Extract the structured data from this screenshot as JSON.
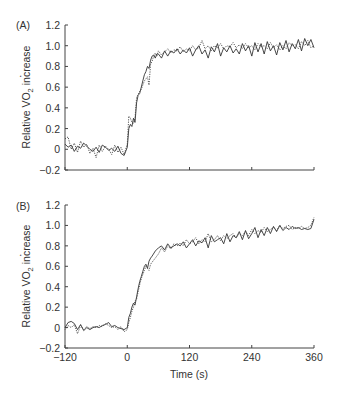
{
  "chart_data": [
    {
      "type": "line",
      "panel_label": "(A)",
      "title": "",
      "xlabel": "",
      "ylabel": "Relative V̇O2 increase",
      "xlim": [
        -120,
        360
      ],
      "ylim": [
        -0.2,
        1.2
      ],
      "x_ticks": [
        -120,
        0,
        120,
        240,
        360
      ],
      "x_tick_labels_shown": false,
      "y_ticks": [
        -0.2,
        0,
        0.2,
        0.4,
        0.6,
        0.8,
        1.0,
        1.2
      ],
      "y_tick_labels": [
        "−0.2",
        "0",
        "0.2",
        "0.4",
        "0.6",
        "0.8",
        "1.0",
        "1.2"
      ],
      "grid": false,
      "legend": null,
      "series": [
        {
          "name": "solid",
          "style": "solid",
          "x": [
            -120,
            -114,
            -108,
            -102,
            -96,
            -90,
            -84,
            -78,
            -72,
            -66,
            -60,
            -54,
            -48,
            -42,
            -36,
            -30,
            -24,
            -18,
            -12,
            -6,
            0,
            3,
            6,
            9,
            12,
            15,
            18,
            21,
            24,
            27,
            30,
            33,
            36,
            39,
            42,
            45,
            48,
            51,
            54,
            57,
            60,
            66,
            72,
            78,
            84,
            90,
            96,
            102,
            108,
            114,
            120,
            126,
            132,
            138,
            144,
            150,
            156,
            162,
            168,
            174,
            180,
            186,
            192,
            198,
            204,
            210,
            216,
            222,
            228,
            234,
            240,
            246,
            252,
            258,
            264,
            270,
            276,
            282,
            288,
            294,
            300,
            306,
            312,
            318,
            324,
            330,
            336,
            342,
            348,
            354,
            360
          ],
          "y": [
            0.05,
            0.02,
            0.04,
            -0.02,
            0.03,
            0.01,
            0.06,
            0.03,
            0.0,
            -0.02,
            0.02,
            -0.03,
            0.04,
            0.02,
            -0.01,
            0.01,
            -0.02,
            0.03,
            -0.04,
            -0.06,
            0.02,
            0.2,
            0.24,
            0.22,
            0.3,
            0.26,
            0.45,
            0.52,
            0.54,
            0.6,
            0.66,
            0.72,
            0.75,
            0.8,
            0.78,
            0.86,
            0.9,
            0.91,
            0.88,
            0.92,
            0.92,
            0.88,
            0.95,
            0.9,
            0.95,
            0.93,
            0.97,
            0.92,
            0.96,
            0.93,
            0.98,
            0.9,
            0.96,
            1.0,
            0.92,
            0.96,
            0.88,
            0.99,
            0.94,
            1.02,
            0.9,
            0.98,
            0.94,
            1.0,
            0.93,
            0.97,
            0.92,
            1.02,
            0.95,
            1.0,
            0.9,
            1.03,
            0.94,
            1.02,
            0.92,
            1.04,
            0.95,
            1.0,
            0.91,
            1.03,
            0.96,
            1.05,
            0.94,
            1.02,
            0.97,
            1.06,
            0.95,
            1.07,
            1.0,
            1.06,
            0.98
          ]
        },
        {
          "name": "dotted",
          "style": "dotted",
          "x": [
            -120,
            -114,
            -108,
            -102,
            -96,
            -90,
            -84,
            -78,
            -72,
            -66,
            -60,
            -54,
            -48,
            -42,
            -36,
            -30,
            -24,
            -18,
            -12,
            -6,
            0,
            3,
            6,
            9,
            12,
            15,
            18,
            21,
            24,
            27,
            30,
            33,
            36,
            39,
            42,
            45,
            48,
            51,
            54,
            57,
            60,
            66,
            72,
            78,
            84,
            90,
            96,
            102,
            108,
            114,
            120,
            126,
            132,
            138,
            144,
            150,
            156,
            162,
            168,
            174,
            180,
            186,
            192,
            198,
            204,
            210,
            216,
            222,
            228,
            234,
            240,
            246,
            252,
            258,
            264,
            270,
            276,
            282,
            288,
            294,
            300,
            306,
            312,
            318,
            324,
            330,
            336,
            342,
            348,
            354,
            360
          ],
          "y": [
            0.1,
            0.12,
            0.0,
            0.06,
            -0.03,
            0.08,
            0.02,
            0.05,
            -0.04,
            0.01,
            -0.08,
            0.04,
            -0.02,
            0.03,
            0.0,
            -0.05,
            0.04,
            -0.03,
            0.02,
            -0.05,
            0.05,
            0.32,
            0.3,
            0.26,
            0.25,
            0.3,
            0.5,
            0.53,
            0.56,
            0.58,
            0.62,
            0.66,
            0.68,
            0.7,
            0.62,
            0.82,
            0.85,
            0.9,
            0.93,
            0.9,
            0.95,
            0.91,
            0.94,
            0.97,
            0.93,
            0.96,
            0.95,
            0.99,
            0.94,
            0.97,
            0.95,
            1.0,
            0.96,
            0.98,
            1.05,
            0.97,
            1.0,
            0.95,
            1.0,
            0.98,
            1.02,
            0.97,
            1.0,
            0.99,
            1.03,
            0.98,
            1.01,
            0.97,
            1.02,
            0.98,
            1.0,
            0.96,
            1.02,
            0.99,
            1.0,
            0.97,
            1.03,
            0.98,
            1.01,
            0.96,
            1.0,
            0.97,
            1.03,
            1.0,
            1.01,
            0.97,
            1.04,
            1.0,
            1.05,
            0.98,
            1.0
          ]
        }
      ]
    },
    {
      "type": "line",
      "panel_label": "(B)",
      "title": "",
      "xlabel": "Time (s)",
      "ylabel": "Relative V̇O2 increase",
      "xlim": [
        -120,
        360
      ],
      "ylim": [
        -0.2,
        1.2
      ],
      "x_ticks": [
        -120,
        0,
        120,
        240,
        360
      ],
      "x_tick_labels": [
        "−120",
        "0",
        "120",
        "240",
        "360"
      ],
      "y_ticks": [
        -0.2,
        0,
        0.2,
        0.4,
        0.6,
        0.8,
        1.0,
        1.2
      ],
      "y_tick_labels": [
        "−0.2",
        "0",
        "0.2",
        "0.4",
        "0.6",
        "0.8",
        "1.0",
        "1.2"
      ],
      "grid": false,
      "legend": null,
      "series": [
        {
          "name": "solid",
          "style": "solid",
          "x": [
            -120,
            -114,
            -108,
            -102,
            -96,
            -90,
            -84,
            -78,
            -72,
            -66,
            -60,
            -54,
            -48,
            -42,
            -36,
            -30,
            -24,
            -18,
            -12,
            -6,
            0,
            3,
            6,
            9,
            12,
            15,
            18,
            21,
            24,
            27,
            30,
            33,
            36,
            39,
            42,
            45,
            48,
            54,
            60,
            66,
            72,
            78,
            84,
            90,
            96,
            102,
            108,
            114,
            120,
            126,
            132,
            138,
            144,
            150,
            156,
            162,
            168,
            174,
            180,
            186,
            192,
            198,
            204,
            210,
            216,
            222,
            228,
            234,
            240,
            246,
            252,
            258,
            264,
            270,
            276,
            282,
            288,
            294,
            300,
            306,
            312,
            318,
            324,
            330,
            336,
            342,
            348,
            354,
            360
          ],
          "y": [
            0.0,
            0.05,
            0.06,
            0.04,
            -0.02,
            0.03,
            -0.03,
            0.0,
            -0.02,
            0.0,
            0.01,
            0.0,
            0.02,
            0.03,
            0.05,
            0.01,
            0.02,
            0.0,
            -0.01,
            -0.02,
            0.0,
            0.1,
            0.14,
            0.2,
            0.24,
            0.22,
            0.3,
            0.38,
            0.45,
            0.5,
            0.55,
            0.6,
            0.62,
            0.58,
            0.65,
            0.68,
            0.7,
            0.75,
            0.78,
            0.8,
            0.76,
            0.82,
            0.78,
            0.8,
            0.82,
            0.8,
            0.84,
            0.78,
            0.82,
            0.86,
            0.8,
            0.85,
            0.83,
            0.88,
            0.78,
            0.9,
            0.84,
            0.86,
            0.88,
            0.82,
            0.92,
            0.84,
            0.9,
            0.88,
            0.94,
            0.86,
            0.95,
            0.87,
            0.92,
            0.98,
            0.88,
            0.96,
            0.9,
            0.98,
            0.92,
            0.99,
            0.94,
            1.0,
            0.95,
            0.98,
            0.96,
            0.99,
            0.97,
            0.98,
            0.96,
            0.97,
            0.96,
            0.97,
            1.06
          ]
        },
        {
          "name": "dotted",
          "style": "dotted",
          "x": [
            -120,
            -114,
            -108,
            -102,
            -96,
            -90,
            -84,
            -78,
            -72,
            -66,
            -60,
            -54,
            -48,
            -42,
            -36,
            -30,
            -24,
            -18,
            -12,
            -6,
            0,
            3,
            6,
            9,
            12,
            15,
            18,
            21,
            24,
            27,
            30,
            33,
            36,
            39,
            42,
            45,
            48,
            54,
            60,
            66,
            72,
            78,
            84,
            90,
            96,
            102,
            108,
            114,
            120,
            126,
            132,
            138,
            144,
            150,
            156,
            162,
            168,
            174,
            180,
            186,
            192,
            198,
            204,
            210,
            216,
            222,
            228,
            234,
            240,
            246,
            252,
            258,
            264,
            270,
            276,
            282,
            288,
            294,
            300,
            306,
            312,
            318,
            324,
            330,
            336,
            342,
            348,
            354,
            360
          ],
          "y": [
            -0.02,
            0.02,
            0.0,
            0.03,
            -0.06,
            0.02,
            -0.02,
            0.01,
            -0.01,
            0.01,
            0.0,
            0.02,
            0.01,
            0.04,
            0.02,
            0.0,
            0.01,
            -0.02,
            0.01,
            -0.04,
            -0.02,
            0.05,
            0.1,
            0.16,
            0.2,
            0.26,
            0.28,
            0.35,
            0.42,
            0.48,
            0.52,
            0.56,
            0.6,
            0.58,
            0.56,
            0.62,
            0.64,
            0.68,
            0.72,
            0.78,
            0.74,
            0.8,
            0.77,
            0.82,
            0.8,
            0.83,
            0.8,
            0.86,
            0.82,
            0.84,
            0.88,
            0.82,
            0.86,
            0.84,
            0.92,
            0.84,
            0.86,
            0.9,
            0.85,
            0.9,
            0.87,
            0.9,
            0.92,
            0.88,
            0.92,
            0.9,
            0.94,
            0.9,
            0.96,
            0.92,
            0.95,
            0.93,
            0.98,
            0.94,
            0.96,
            0.98,
            0.95,
            1.0,
            0.97,
            0.99,
            1.0,
            0.96,
            0.98,
            0.97,
            0.99,
            0.97,
            0.98,
            1.0,
            1.08
          ]
        }
      ]
    }
  ],
  "panels": {
    "a": {
      "label": "(A)"
    },
    "b": {
      "label": "(B)",
      "xlabel": "Time (s)"
    }
  },
  "ylabel": {
    "prefix": "Relative ",
    "v": "V",
    "sub": "2",
    "o": "O",
    "suffix": " increase"
  }
}
